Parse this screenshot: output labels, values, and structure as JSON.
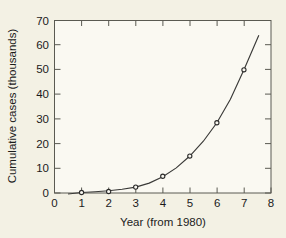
{
  "chart_data": {
    "type": "scatter",
    "title": "",
    "subtitle": "",
    "xlabel": "Year (from 1980)",
    "ylabel": "Cumulative cases (thousands)",
    "xlim": [
      0,
      8
    ],
    "ylim": [
      0,
      70
    ],
    "xticks": [
      0,
      1,
      2,
      3,
      4,
      5,
      6,
      7,
      8
    ],
    "xtick_labels": [
      "0",
      "1",
      "2",
      "3",
      "4",
      "5",
      "6",
      "7",
      "8"
    ],
    "yticks": [
      0,
      10,
      20,
      30,
      40,
      50,
      60,
      70
    ],
    "ytick_labels": [
      "0",
      "10",
      "20",
      "30",
      "40",
      "50",
      "60",
      "70"
    ],
    "grid": false,
    "legend": null,
    "series": [
      {
        "name": "Cumulative cases",
        "marker": "circle",
        "x": [
          1,
          2,
          3,
          4,
          5,
          6,
          7
        ],
        "values": [
          0.2,
          0.6,
          2.4,
          6.8,
          15.0,
          28.5,
          50.0
        ]
      },
      {
        "name": "Fitted exponential curve",
        "type": "line",
        "x_range": [
          0.5,
          7.55
        ],
        "curve_points_x": [
          0.5,
          1.0,
          1.5,
          2.0,
          2.5,
          3.0,
          3.5,
          4.0,
          4.5,
          5.0,
          5.5,
          6.0,
          6.5,
          7.0,
          7.55
        ],
        "curve_points_y": [
          -0.4,
          0.2,
          0.5,
          0.9,
          1.5,
          2.4,
          4.0,
          6.6,
          10.2,
          15.0,
          21.0,
          28.5,
          38.0,
          50.0,
          64.0
        ]
      }
    ],
    "annotations": []
  },
  "figure": {
    "background_color": "#f3f1e4",
    "plot_background_color": "#faf9f2",
    "axis_color": "#5a5a52",
    "curve_color": "#3a3a38",
    "marker_color": "#2b2b2a",
    "text_color": "#1b1b1b"
  }
}
